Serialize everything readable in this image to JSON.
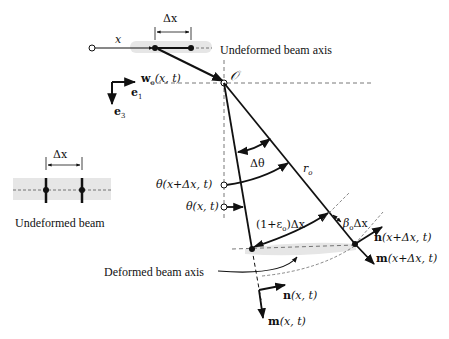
{
  "labels": {
    "x": "x",
    "dx_top": "Δx",
    "undeformed_axis": "Undeformed beam axis",
    "w_displacement": "w",
    "w_sub": "o",
    "w_args": "(x, t)",
    "origin": "𝒪",
    "e1": "e",
    "e1_sub": "1",
    "e3": "e",
    "e3_sub": "3",
    "dx_left": "Δx",
    "undeformed_beam": "Undeformed beam",
    "theta_x_dx": "θ(x+Δx, t)",
    "theta_x": "θ(x, t)",
    "dtheta": "Δθ",
    "r": "r",
    "r_sub": "o",
    "arc_length": "(1+ε",
    "arc_length_sub": "o",
    "arc_length_tail": ")Δx",
    "beta": "β",
    "beta_sub": "o",
    "beta_tail": "Δx",
    "n_right": "n",
    "n_right_args": "(x+Δx, t)",
    "m_right": "m",
    "m_right_args": "(x+Δx, t)",
    "deformed_axis": "Deformed beam axis",
    "n_left": "n",
    "n_left_args": "(x, t)",
    "m_left": "m",
    "m_left_args": "(x, t)"
  },
  "colors": {
    "ink": "#111111",
    "shade": "#e6e6e6",
    "dash": "#555555"
  }
}
